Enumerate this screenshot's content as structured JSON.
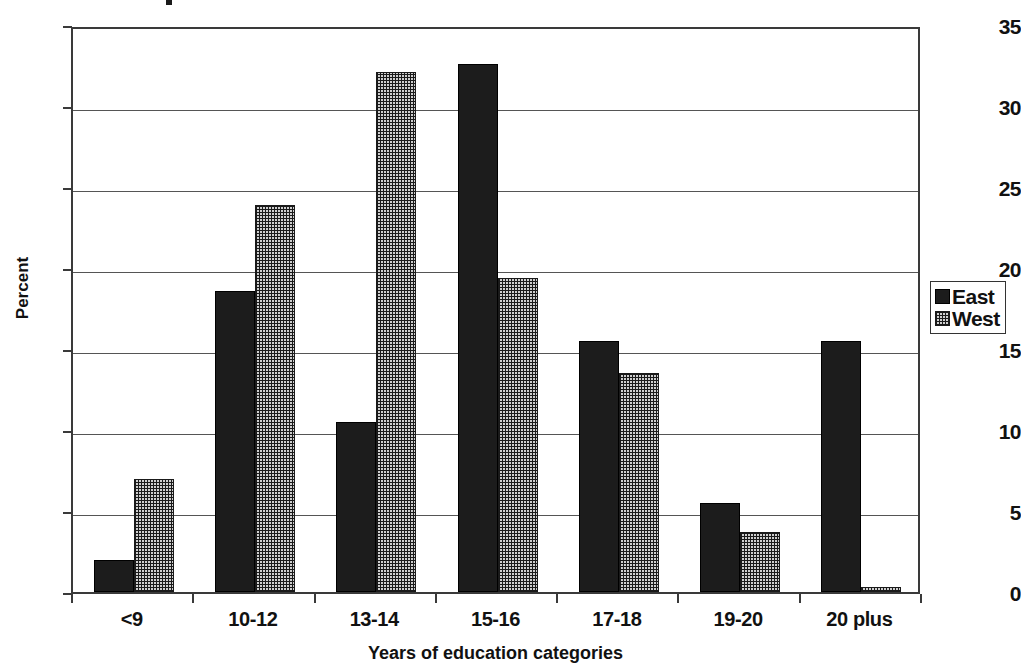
{
  "chart_data": {
    "type": "bar",
    "title": "",
    "xlabel": "Years of education categories",
    "ylabel": "Percent",
    "categories": [
      "<9",
      "10-12",
      "13-14",
      "15-16",
      "17-18",
      "19-20",
      "20 plus"
    ],
    "series": [
      {
        "name": "East",
        "color": "#1c1c1c",
        "pattern": "solid",
        "values": [
          2.0,
          18.6,
          10.5,
          32.6,
          15.5,
          5.5,
          15.5
        ]
      },
      {
        "name": "West",
        "color": "#cfcfcf",
        "pattern": "stipple",
        "values": [
          7.0,
          23.9,
          32.1,
          19.4,
          13.5,
          3.7,
          0.3
        ]
      }
    ],
    "ylim": [
      0,
      35
    ],
    "ytick_labels": [
      "0",
      "5",
      "10",
      "15",
      "20",
      "25",
      "30",
      "35"
    ],
    "ytick_values": [
      0,
      5,
      10,
      15,
      20,
      25,
      30,
      35
    ],
    "grid": "horizontal",
    "legend_position": "right",
    "legend_entries": [
      "East",
      "West"
    ]
  }
}
